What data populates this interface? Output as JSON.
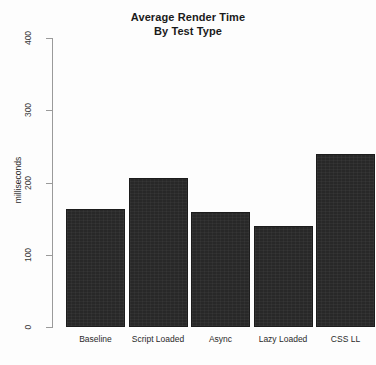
{
  "chart_data": {
    "type": "bar",
    "title": "Average Render Time",
    "subtitle": "By Test Type",
    "xlabel": "",
    "ylabel": "milliseconds",
    "categories": [
      "Baseline",
      "Script Loaded",
      "Async",
      "Lazy Loaded",
      "CSS LL"
    ],
    "values": [
      163,
      206,
      159,
      140,
      240
    ],
    "ylim": [
      0,
      400
    ],
    "yticks": [
      0,
      100,
      200,
      300,
      400
    ],
    "ytick_labels": [
      "0",
      "100",
      "200",
      "300",
      "400"
    ],
    "grid": false,
    "legend": false,
    "bar_color": "#282828",
    "axis_color": "#9a9a9a",
    "background_color": "#fdfdfd"
  },
  "title": {
    "line1": "Average Render Time",
    "line2": "By Test Type"
  },
  "axes": {
    "y_title": "milliseconds"
  }
}
